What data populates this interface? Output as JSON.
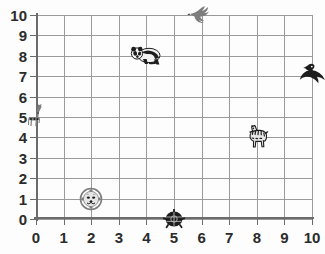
{
  "chart_data": {
    "type": "scatter",
    "title": "",
    "xlabel": "",
    "ylabel": "",
    "xlim": [
      0,
      10
    ],
    "ylim": [
      0,
      10
    ],
    "grid": true,
    "legend": "none",
    "x_ticks": [
      "0",
      "1",
      "2",
      "3",
      "4",
      "5",
      "6",
      "7",
      "8",
      "9",
      "10"
    ],
    "y_ticks": [
      "0",
      "1",
      "2",
      "3",
      "4",
      "5",
      "6",
      "7",
      "8",
      "9",
      "10"
    ],
    "points": [
      {
        "label": "giraffe",
        "x": 0,
        "y": 5,
        "icon": "giraffe-icon"
      },
      {
        "label": "lion",
        "x": 2,
        "y": 1,
        "icon": "lion-face-icon"
      },
      {
        "label": "panda",
        "x": 4,
        "y": 8,
        "icon": "panda-icon"
      },
      {
        "label": "turtle",
        "x": 5,
        "y": 0,
        "icon": "turtle-icon"
      },
      {
        "label": "bird",
        "x": 6,
        "y": 10,
        "icon": "bird-icon"
      },
      {
        "label": "zebra",
        "x": 8,
        "y": 4,
        "icon": "zebra-icon"
      },
      {
        "label": "seal",
        "x": 10,
        "y": 7,
        "icon": "seal-icon"
      }
    ],
    "colors": {
      "background": "#fdfdfd",
      "gridline": "#9a9a9a",
      "axis": "#6b6b6b",
      "tick_label": "#2b2b2b",
      "marker_dark": "#1d1d1d",
      "marker_mid": "#7d7d7d"
    }
  }
}
